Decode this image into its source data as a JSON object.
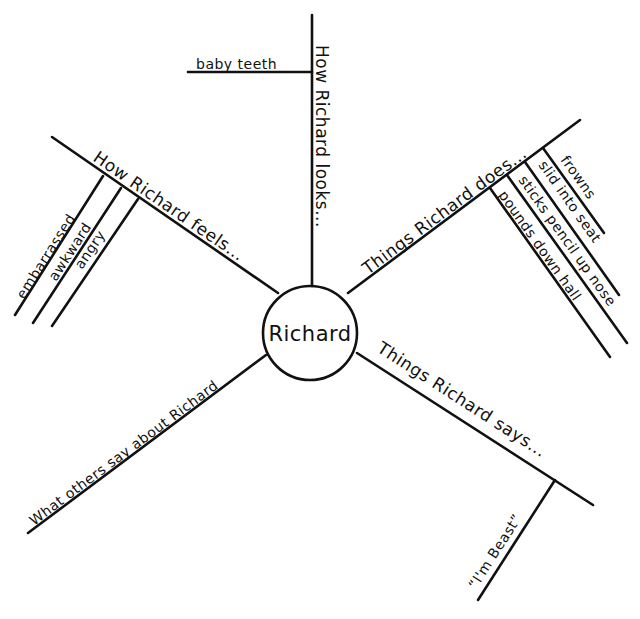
{
  "diagram": {
    "type": "character-web",
    "center": {
      "label": "Richard"
    },
    "colors": {
      "ink": "#111111",
      "background": "#ffffff"
    },
    "branches": [
      {
        "id": "looks",
        "label": "How Richard looks...",
        "details": [
          "baby teeth"
        ]
      },
      {
        "id": "feels",
        "label": "How Richard feels...",
        "details": [
          "embarrassed",
          "awkward",
          "angry"
        ]
      },
      {
        "id": "does",
        "label": "Things Richard does...",
        "details": [
          "frowns",
          "slid into seat",
          "sticks pencil up nose",
          "pounds down hall"
        ]
      },
      {
        "id": "says",
        "label": "Things Richard says...",
        "details": [
          "“I'm Beast”"
        ]
      },
      {
        "id": "others",
        "label": "What others say about Richard",
        "details": []
      }
    ]
  }
}
